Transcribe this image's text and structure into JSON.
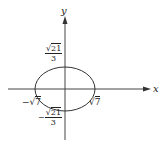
{
  "figure": {
    "axes": {
      "x_label": "x",
      "y_label": "y"
    },
    "shape": "ellipse",
    "labels": {
      "y_top": {
        "radical": "21",
        "denominator": "3"
      },
      "y_bottom": {
        "sign": "−",
        "radical": "21",
        "denominator": "3"
      },
      "x_left": {
        "sign": "−",
        "radical": "7"
      },
      "x_right": {
        "radical": "7"
      },
      "sqrt_symbol": "√"
    },
    "colors": {
      "stroke": "#333333",
      "background": "#ffffff"
    }
  }
}
